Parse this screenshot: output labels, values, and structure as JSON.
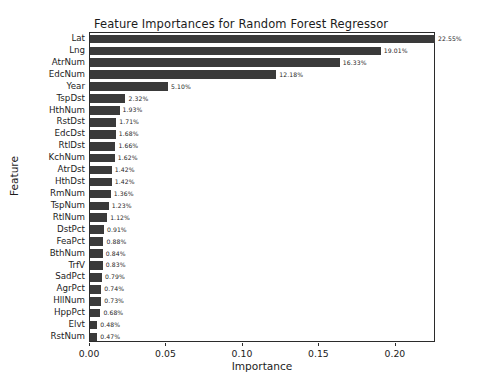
{
  "chart_data": {
    "type": "bar",
    "orientation": "horizontal",
    "title": "Feature Importances for Random Forest Regressor",
    "xlabel": "Importance",
    "ylabel": "Feature",
    "xlim": [
      0.0,
      0.2262
    ],
    "xticks": [
      0.0,
      0.05,
      0.1,
      0.15,
      0.2
    ],
    "xticklabels": [
      "0.00",
      "0.05",
      "0.10",
      "0.15",
      "0.20"
    ],
    "grid": false,
    "legend": null,
    "bar_color": "#3a3a3a",
    "categories": [
      "Lat",
      "Lng",
      "AtrNum",
      "EdcNum",
      "Year",
      "TspDst",
      "HthNum",
      "RstDst",
      "EdcDst",
      "RtlDst",
      "KchNum",
      "AtrDst",
      "HthDst",
      "RmNum",
      "TspNum",
      "RtlNum",
      "DstPct",
      "FeaPct",
      "BthNum",
      "TrfV",
      "SadPct",
      "AgrPct",
      "HllNum",
      "HppPct",
      "Elvt",
      "RstNum"
    ],
    "values": [
      0.2255,
      0.1901,
      0.1633,
      0.1218,
      0.051,
      0.0232,
      0.0193,
      0.0171,
      0.0168,
      0.0166,
      0.0162,
      0.0142,
      0.0142,
      0.0136,
      0.0123,
      0.0112,
      0.0091,
      0.0088,
      0.0084,
      0.0083,
      0.0079,
      0.0074,
      0.0073,
      0.0068,
      0.0048,
      0.0047
    ],
    "data_labels": [
      "22.55%",
      "19.01%",
      "16.33%",
      "12.18%",
      "5.10%",
      "2.32%",
      "1.93%",
      "1.71%",
      "1.68%",
      "1.66%",
      "1.62%",
      "1.42%",
      "1.42%",
      "1.36%",
      "1.23%",
      "1.12%",
      "0.91%",
      "0.88%",
      "0.84%",
      "0.83%",
      "0.79%",
      "0.74%",
      "0.73%",
      "0.68%",
      "0.48%",
      "0.47%"
    ]
  }
}
